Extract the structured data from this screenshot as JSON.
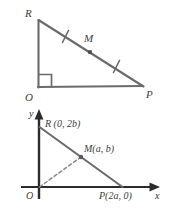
{
  "figure": {
    "title_visible": false,
    "stroke_color": "#6b6b6b",
    "dark_stroke_color": "#3a3a3a",
    "label_color": "#3d3d3d",
    "background": "#ffffff"
  },
  "top_diagram": {
    "name": "right-triangle-ROP-with-midpoint",
    "vertices": [
      {
        "id": "R",
        "label": "R",
        "x": 38,
        "y": 19
      },
      {
        "id": "O",
        "label": "O",
        "x": 38,
        "y": 87
      },
      {
        "id": "P",
        "label": "P",
        "x": 143,
        "y": 86
      }
    ],
    "midpoint": {
      "id": "M",
      "label": "M",
      "x": 90,
      "y": 52
    },
    "right_angle_at": "O",
    "congruence_ticks": 2,
    "vertex_labels": {
      "R": "R",
      "O": "O",
      "M": "M",
      "P": "P"
    }
  },
  "bottom_diagram": {
    "name": "coordinate-plane-triangle-ROP",
    "axes": {
      "x_axis_label": "x",
      "y_axis_label": "y",
      "origin_label": "O",
      "x_axis_y": 187,
      "y_axis_x": 39
    },
    "points": [
      {
        "id": "R",
        "label": "R (0, 2b)",
        "px": 39,
        "py": 127
      },
      {
        "id": "M",
        "label": "M(a, b)",
        "px": 81,
        "py": 157
      },
      {
        "id": "P",
        "label": "P(2a, 0)",
        "px": 122,
        "py": 187
      }
    ],
    "median_style": "dashed",
    "median_from": "O",
    "median_to": "M",
    "labels": {
      "R": "R (0, 2b)",
      "M": "M(a, b)",
      "P": "P(2a, 0)",
      "origin": "O",
      "x": "x",
      "y": "y"
    }
  }
}
